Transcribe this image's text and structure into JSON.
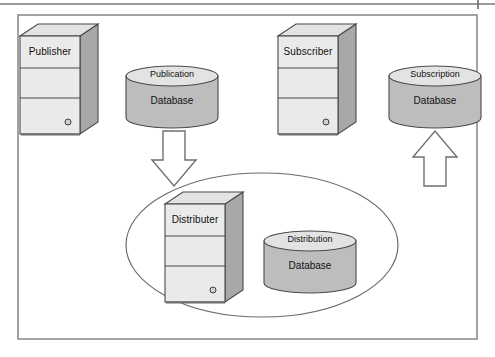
{
  "figure": {
    "kind": "replication-architecture-diagram",
    "title_visible": false,
    "canvas": {
      "width": 495,
      "height": 357
    },
    "colors": {
      "page_background": "#ffffff",
      "panel_background": "#ffffff",
      "panel_border": "#8c8c8c",
      "top_rule": "#7a7a7a",
      "shape_face_light": "#e9e9e9",
      "shape_face_mid": "#d8d8d8",
      "shape_side_dark": "#a8a8a8",
      "cylinder_body": "#bdbdbd",
      "cylinder_top": "#e3e3e3",
      "outline": "#4a4a4a",
      "ellipse_stroke": "#6b6b6b",
      "arrow_fill": "#ffffff",
      "arrow_stroke": "#6f6f6f",
      "text": "#111111"
    }
  },
  "servers": [
    {
      "id": "publisher",
      "label": "Publisher",
      "x": 18,
      "y": 22,
      "led": true
    },
    {
      "id": "subscriber",
      "label": "Subscriber",
      "x": 276,
      "y": 22,
      "led": true
    },
    {
      "id": "distributer",
      "label": "Distributer",
      "x": 163,
      "y": 190,
      "led": true
    }
  ],
  "databases": [
    {
      "id": "publication-db",
      "top_label": "Publication",
      "body_label": "Database",
      "cx": 172,
      "cy": 98
    },
    {
      "id": "subscription-db",
      "top_label": "Subscription",
      "body_label": "Database",
      "cx": 435,
      "cy": 98
    },
    {
      "id": "distribution-db",
      "top_label": "Distribution",
      "body_label": "Database",
      "cx": 310,
      "cy": 263
    }
  ],
  "arrows": [
    {
      "id": "publisher-to-distributer",
      "direction": "down",
      "from": "publication-db",
      "to": "distributer"
    },
    {
      "id": "distributer-to-subscriber",
      "direction": "up",
      "from": "distribution",
      "to": "subscription-db"
    }
  ],
  "grouping": {
    "id": "distributor-boundary",
    "shape": "ellipse",
    "members": [
      "distributer",
      "distribution-db"
    ]
  }
}
